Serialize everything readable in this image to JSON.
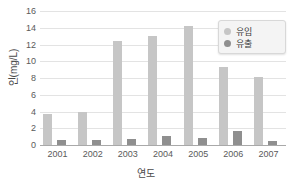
{
  "chart_data": {
    "type": "bar",
    "title": "",
    "xlabel": "연도",
    "ylabel": "인(mg/L)",
    "categories": [
      "2001",
      "2002",
      "2003",
      "2004",
      "2005",
      "2006",
      "2007"
    ],
    "series": [
      {
        "name": "유입",
        "color": "#c6c6c6",
        "values": [
          3.7,
          4.0,
          12.4,
          13.0,
          14.2,
          9.3,
          8.1
        ]
      },
      {
        "name": "유출",
        "color": "#8f8f8f",
        "values": [
          0.6,
          0.6,
          0.75,
          1.1,
          0.85,
          1.65,
          0.45
        ]
      }
    ],
    "ylim": [
      0,
      16
    ],
    "yticks": [
      0,
      2,
      4,
      6,
      8,
      10,
      12,
      14,
      16
    ],
    "ytick_labels": [
      "0",
      "2",
      "4",
      "6",
      "8",
      "10",
      "12",
      "14",
      "16"
    ],
    "grid": true,
    "legend_position": "top-right"
  },
  "legend": {
    "items": [
      {
        "label": "유입"
      },
      {
        "label": "유출"
      }
    ]
  },
  "axes": {
    "y_title": "인(mg/L)",
    "x_title": "연도"
  },
  "colors": {
    "inflow": "#c6c6c6",
    "outflow": "#8f8f8f",
    "gridline": "#e3e3e3",
    "axis": "#a9a9a9",
    "text": "#5a5a5a",
    "background": "#ffffff"
  }
}
